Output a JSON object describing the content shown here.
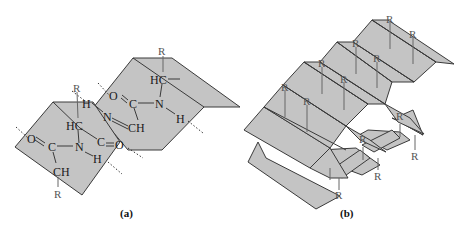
{
  "figure": {
    "panels": [
      {
        "id": "a",
        "caption": "(a)",
        "description": "Two adjacent pleated peptide planes with hydrogen bonds between strands",
        "atoms": {
          "r_top": "R",
          "hc_top": "HC",
          "o_top": "O",
          "c_top": "C",
          "n_top": "N",
          "h_top": "H",
          "h_mid": "H",
          "n_mid": "N",
          "ch_mid": "CH",
          "r_mid": "R",
          "hc_mid": "HC",
          "c_mid": "C",
          "o_mid": "O",
          "o_left": "O",
          "c_left": "C",
          "n_left": "N",
          "h_left": "H",
          "ch_bottom": "CH",
          "r_bottom": "R"
        }
      },
      {
        "id": "b",
        "caption": "(b)",
        "description": "Stacked pleated beta-sheet with side chains (R) projecting above and below",
        "r_labels": [
          "R",
          "R",
          "R",
          "R",
          "R",
          "R",
          "R",
          "R",
          "R",
          "R",
          "R",
          "R",
          "R"
        ]
      }
    ],
    "colors": {
      "plane_fill": "#c4c4c4",
      "line": "#3a3a3a",
      "background": "#ffffff"
    }
  }
}
